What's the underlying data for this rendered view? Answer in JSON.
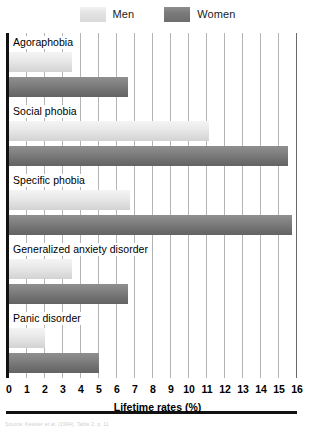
{
  "legend": {
    "entries": [
      {
        "label": "Men",
        "key": "men",
        "color": "#e2e2e2"
      },
      {
        "label": "Women",
        "key": "women",
        "color": "#7a7a7a"
      }
    ]
  },
  "axis": {
    "title": "Lifetime rates (%)",
    "ticks": [
      "0",
      "1",
      "2",
      "3",
      "4",
      "5",
      "6",
      "7",
      "8",
      "9",
      "10",
      "11",
      "12",
      "13",
      "14",
      "15",
      "16"
    ]
  },
  "source_note": "Source: Kessler et al. (1994), Table 2, p. 11",
  "chart_data": {
    "type": "bar",
    "orientation": "horizontal",
    "title": "",
    "subtitle": "",
    "xlabel": "Lifetime rates (%)",
    "ylabel": "",
    "xlim": [
      0,
      16
    ],
    "xticks": [
      0,
      1,
      2,
      3,
      4,
      5,
      6,
      7,
      8,
      9,
      10,
      11,
      12,
      13,
      14,
      15,
      16
    ],
    "grid": "vertical",
    "legend_position": "top-center",
    "categories": [
      "Agoraphobia",
      "Social phobia",
      "Specific phobia",
      "Generalized anxiety disorder",
      "Panic disorder"
    ],
    "series": [
      {
        "name": "Men",
        "color": "#e2e2e2",
        "values": [
          3.5,
          11.1,
          6.7,
          3.5,
          2.0
        ]
      },
      {
        "name": "Women",
        "color": "#7a7a7a",
        "values": [
          6.6,
          15.5,
          15.7,
          6.6,
          5.0
        ]
      }
    ]
  }
}
